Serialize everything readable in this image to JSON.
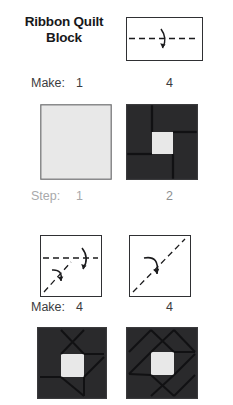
{
  "page": {
    "background_color": "#ffffff",
    "title_line1": "Ribbon Quilt",
    "title_line2": "Block"
  },
  "colors": {
    "fabric_dark": "#2a2a2c",
    "fabric_light": "#e8e8e8",
    "outline": "#2f3033",
    "text_dark": "#17181a",
    "text_gray": "#3b3c3e",
    "text_light_gray": "#a8a9ab",
    "seam_line": "#1b1b1d"
  },
  "rows": {
    "make_top": {
      "label": "Make:",
      "count_left": "1",
      "count_right": "4"
    },
    "step": {
      "label": "Step:",
      "count_left": "1",
      "count_right": "2"
    },
    "make_bottom": {
      "label": "Make:",
      "count_left": "4",
      "count_right": "4"
    }
  },
  "diagrams": {
    "fold_rectangle": {
      "name": "rectangle-with-horizontal-fold",
      "shape": "rectangle",
      "fold_lines": [
        "horizontal-center-dashed"
      ],
      "arrows": [
        "curved-fold-arrow-center"
      ]
    },
    "fold_square_left": {
      "name": "square-with-horizontal-and-diagonal-folds",
      "shape": "square",
      "fold_lines": [
        "horizontal-center-dashed",
        "diagonal-bottom-left-dashed"
      ],
      "arrows": [
        "curved-fold-arrow-left",
        "curved-fold-arrow-right"
      ]
    },
    "fold_square_right": {
      "name": "square-with-diagonal-fold",
      "shape": "square",
      "fold_lines": [
        "diagonal-bottom-left-to-top-right-dashed"
      ],
      "arrows": [
        "curved-fold-arrow-center"
      ]
    }
  },
  "blocks": {
    "plain_square": {
      "name": "plain-light-square",
      "fill": "#e8e8e8",
      "pieces": 1
    },
    "pinwheel_logcabin": {
      "name": "pinwheel-log-cabin-block",
      "center_fill": "#e8e8e8",
      "surround_fill": "#2a2a2c",
      "pieces": 4
    },
    "ribbon_block_simple": {
      "name": "ribbon-block-partial",
      "center_fill": "#e8e8e8",
      "surround_fill": "#2a2a2c"
    },
    "ribbon_block_full": {
      "name": "ribbon-block-complete",
      "center_fill": "#e8e8e8",
      "surround_fill": "#2a2a2c"
    }
  }
}
